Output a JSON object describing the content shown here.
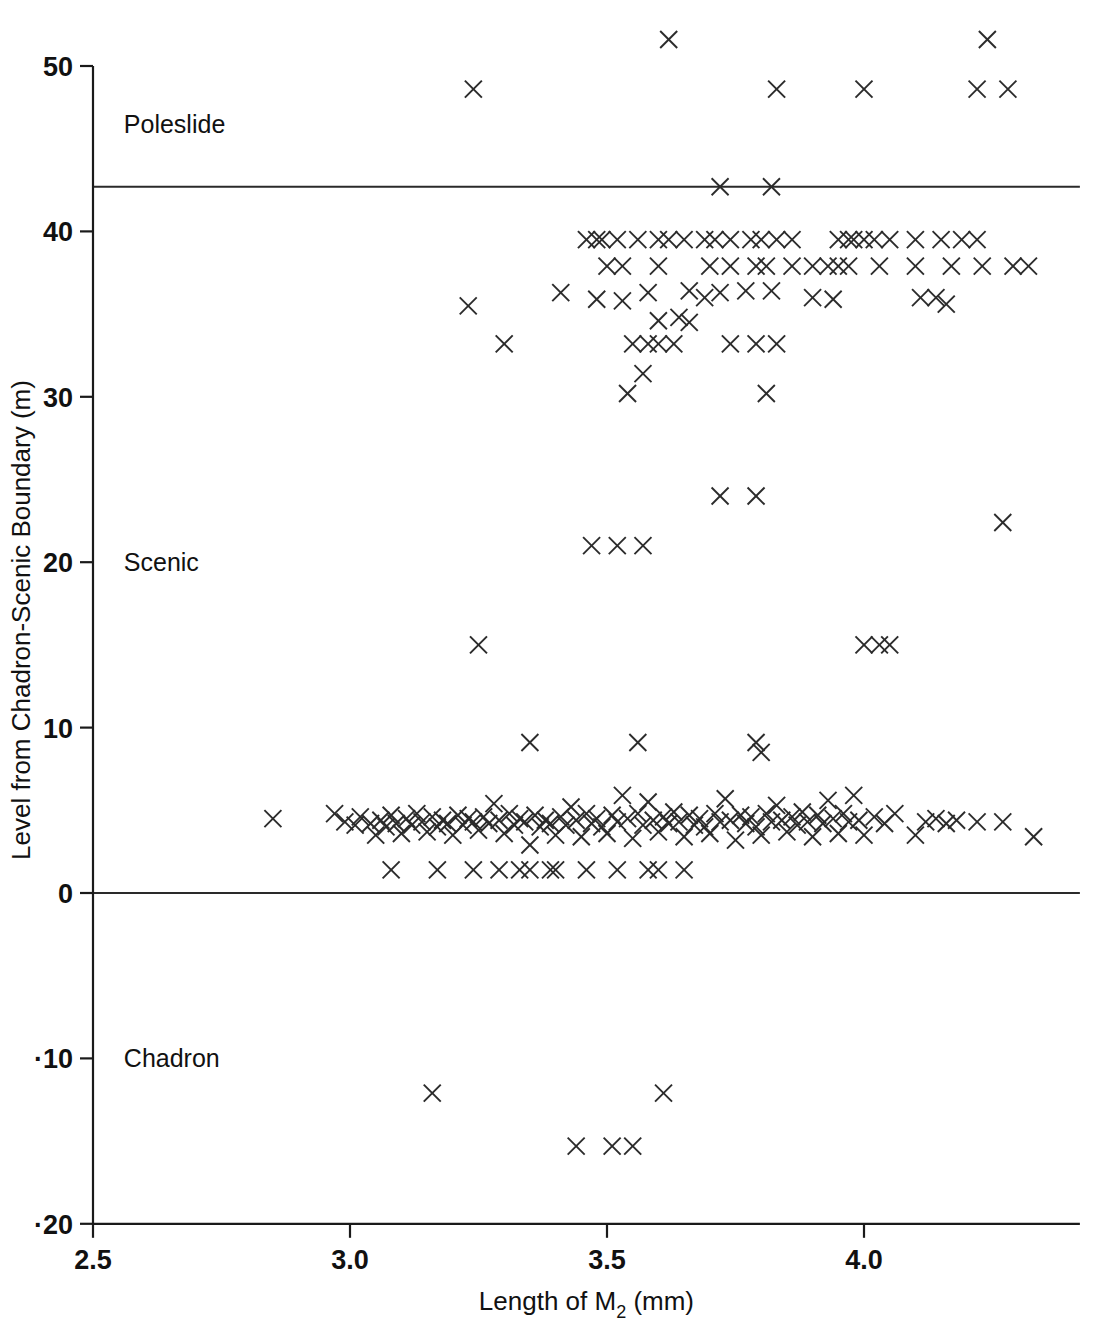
{
  "figure": {
    "kind": "scatter-plot",
    "background_color": "#ffffff",
    "ink_color": "#1a1a1a",
    "marker_glyph": "X"
  },
  "axes": {
    "y_title": "Level from Chadron-Scenic Boundary (m)",
    "x_title_parts": {
      "before": "Length of M",
      "subscript": "2",
      "after": " (mm)"
    },
    "x_title_plain": "Length of M2 (mm)",
    "y_ticks": [
      "50",
      "40",
      "30",
      "20",
      "10",
      "0",
      "·10",
      "·20"
    ],
    "y_tick_values": [
      50,
      40,
      30,
      20,
      10,
      0,
      -10,
      -20
    ],
    "x_ticks": [
      "2.5",
      "3.0",
      "3.5",
      "4.0"
    ],
    "x_tick_values": [
      2.5,
      3.0,
      3.5,
      4.0
    ]
  },
  "unit_labels": [
    {
      "name": "Poleslide",
      "level": 46.5
    },
    {
      "name": "Scenic",
      "level": 20.0
    },
    {
      "name": "Chadron",
      "level": -10.0
    }
  ],
  "boundaries": [
    {
      "label": "Poleslide-Scenic boundary",
      "level": 42.7
    },
    {
      "label": "Chadron-Scenic boundary",
      "level": 0.0
    },
    {
      "label": "lower plot frame",
      "level": -20.0
    }
  ],
  "chart_data": {
    "type": "scatter",
    "title": "",
    "xlabel": "Length of M2 (mm)",
    "ylabel": "Level from Chadron-Scenic Boundary (m)",
    "xlim": [
      2.5,
      4.4
    ],
    "ylim": [
      -20,
      52.5
    ],
    "grid": false,
    "legend": "none",
    "marker": "x",
    "series": [
      {
        "name": "Specimens",
        "points": [
          [
            3.62,
            51.6
          ],
          [
            4.24,
            51.6
          ],
          [
            3.24,
            48.6
          ],
          [
            3.83,
            48.6
          ],
          [
            4.0,
            48.6
          ],
          [
            4.22,
            48.6
          ],
          [
            4.28,
            48.6
          ],
          [
            3.72,
            42.7
          ],
          [
            3.82,
            42.7
          ],
          [
            3.46,
            39.5
          ],
          [
            3.48,
            39.5
          ],
          [
            3.49,
            39.5
          ],
          [
            3.52,
            39.5
          ],
          [
            3.56,
            39.5
          ],
          [
            3.6,
            39.5
          ],
          [
            3.62,
            39.5
          ],
          [
            3.65,
            39.5
          ],
          [
            3.69,
            39.5
          ],
          [
            3.71,
            39.5
          ],
          [
            3.74,
            39.5
          ],
          [
            3.78,
            39.5
          ],
          [
            3.8,
            39.5
          ],
          [
            3.83,
            39.5
          ],
          [
            3.86,
            39.5
          ],
          [
            3.95,
            39.5
          ],
          [
            3.97,
            39.5
          ],
          [
            3.98,
            39.5
          ],
          [
            4.0,
            39.5
          ],
          [
            4.02,
            39.5
          ],
          [
            4.05,
            39.5
          ],
          [
            4.1,
            39.5
          ],
          [
            4.15,
            39.5
          ],
          [
            4.19,
            39.5
          ],
          [
            4.22,
            39.5
          ],
          [
            3.5,
            37.9
          ],
          [
            3.53,
            37.9
          ],
          [
            3.6,
            37.9
          ],
          [
            3.7,
            37.9
          ],
          [
            3.74,
            37.9
          ],
          [
            3.79,
            37.9
          ],
          [
            3.81,
            37.9
          ],
          [
            3.86,
            37.9
          ],
          [
            3.9,
            37.9
          ],
          [
            3.93,
            37.9
          ],
          [
            3.95,
            37.9
          ],
          [
            3.97,
            37.9
          ],
          [
            4.03,
            37.9
          ],
          [
            4.1,
            37.9
          ],
          [
            4.17,
            37.9
          ],
          [
            4.23,
            37.9
          ],
          [
            4.29,
            37.9
          ],
          [
            4.32,
            37.9
          ],
          [
            3.23,
            35.5
          ],
          [
            3.41,
            36.3
          ],
          [
            3.48,
            35.9
          ],
          [
            3.53,
            35.8
          ],
          [
            3.58,
            36.3
          ],
          [
            3.66,
            36.4
          ],
          [
            3.69,
            36.0
          ],
          [
            3.72,
            36.3
          ],
          [
            3.77,
            36.4
          ],
          [
            3.82,
            36.4
          ],
          [
            3.9,
            36.0
          ],
          [
            3.94,
            35.9
          ],
          [
            4.11,
            36.0
          ],
          [
            4.14,
            36.0
          ],
          [
            4.16,
            35.6
          ],
          [
            3.6,
            34.6
          ],
          [
            3.64,
            34.8
          ],
          [
            3.66,
            34.5
          ],
          [
            3.3,
            33.2
          ],
          [
            3.55,
            33.2
          ],
          [
            3.58,
            33.2
          ],
          [
            3.6,
            33.2
          ],
          [
            3.63,
            33.2
          ],
          [
            3.74,
            33.2
          ],
          [
            3.79,
            33.2
          ],
          [
            3.83,
            33.2
          ],
          [
            3.57,
            31.4
          ],
          [
            3.54,
            30.2
          ],
          [
            3.81,
            30.2
          ],
          [
            3.72,
            24.0
          ],
          [
            3.79,
            24.0
          ],
          [
            4.27,
            22.4
          ],
          [
            3.47,
            21.0
          ],
          [
            3.52,
            21.0
          ],
          [
            3.57,
            21.0
          ],
          [
            3.25,
            15.0
          ],
          [
            4.0,
            15.0
          ],
          [
            4.03,
            15.0
          ],
          [
            4.05,
            15.0
          ],
          [
            3.35,
            9.1
          ],
          [
            3.56,
            9.1
          ],
          [
            3.79,
            9.1
          ],
          [
            3.8,
            8.5
          ],
          [
            2.85,
            4.5
          ],
          [
            2.97,
            4.8
          ],
          [
            2.99,
            4.3
          ],
          [
            3.01,
            4.1
          ],
          [
            3.02,
            4.6
          ],
          [
            3.04,
            4.2
          ],
          [
            3.05,
            3.5
          ],
          [
            3.06,
            4.4
          ],
          [
            3.07,
            4.0
          ],
          [
            3.08,
            4.7
          ],
          [
            3.09,
            4.2
          ],
          [
            3.1,
            3.6
          ],
          [
            3.11,
            4.5
          ],
          [
            3.12,
            4.1
          ],
          [
            3.13,
            4.8
          ],
          [
            3.14,
            4.3
          ],
          [
            3.15,
            3.7
          ],
          [
            3.16,
            4.6
          ],
          [
            3.17,
            4.0
          ],
          [
            3.18,
            4.4
          ],
          [
            3.19,
            4.2
          ],
          [
            3.2,
            3.5
          ],
          [
            3.21,
            4.7
          ],
          [
            3.22,
            4.1
          ],
          [
            3.23,
            4.5
          ],
          [
            3.24,
            4.3
          ],
          [
            3.25,
            3.8
          ],
          [
            3.26,
            4.6
          ],
          [
            3.27,
            4.2
          ],
          [
            3.28,
            5.4
          ],
          [
            3.29,
            4.4
          ],
          [
            3.3,
            3.6
          ],
          [
            3.31,
            4.8
          ],
          [
            3.32,
            4.1
          ],
          [
            3.33,
            4.5
          ],
          [
            3.34,
            4.3
          ],
          [
            3.35,
            2.9
          ],
          [
            3.36,
            4.7
          ],
          [
            3.37,
            4.0
          ],
          [
            3.38,
            4.4
          ],
          [
            3.39,
            4.2
          ],
          [
            3.4,
            3.5
          ],
          [
            3.41,
            4.6
          ],
          [
            3.42,
            4.1
          ],
          [
            3.43,
            5.2
          ],
          [
            3.44,
            4.4
          ],
          [
            3.45,
            3.4
          ],
          [
            3.46,
            4.8
          ],
          [
            3.47,
            4.2
          ],
          [
            3.48,
            4.5
          ],
          [
            3.49,
            4.0
          ],
          [
            3.5,
            3.6
          ],
          [
            3.51,
            4.7
          ],
          [
            3.52,
            4.3
          ],
          [
            3.53,
            5.9
          ],
          [
            3.54,
            4.5
          ],
          [
            3.55,
            3.3
          ],
          [
            3.56,
            4.8
          ],
          [
            3.57,
            4.1
          ],
          [
            3.58,
            5.5
          ],
          [
            3.59,
            4.4
          ],
          [
            3.6,
            3.7
          ],
          [
            3.61,
            4.6
          ],
          [
            3.62,
            4.2
          ],
          [
            3.63,
            4.9
          ],
          [
            3.64,
            4.3
          ],
          [
            3.65,
            3.4
          ],
          [
            3.66,
            4.7
          ],
          [
            3.67,
            4.1
          ],
          [
            3.68,
            4.5
          ],
          [
            3.69,
            4.0
          ],
          [
            3.7,
            3.6
          ],
          [
            3.71,
            4.8
          ],
          [
            3.72,
            4.3
          ],
          [
            3.73,
            5.7
          ],
          [
            3.74,
            4.4
          ],
          [
            3.75,
            3.2
          ],
          [
            3.76,
            4.7
          ],
          [
            3.77,
            4.2
          ],
          [
            3.78,
            4.6
          ],
          [
            3.79,
            4.0
          ],
          [
            3.8,
            3.5
          ],
          [
            3.81,
            4.8
          ],
          [
            3.82,
            4.3
          ],
          [
            3.83,
            5.3
          ],
          [
            3.84,
            4.4
          ],
          [
            3.85,
            3.7
          ],
          [
            3.86,
            4.6
          ],
          [
            3.87,
            4.1
          ],
          [
            3.88,
            4.9
          ],
          [
            3.89,
            4.3
          ],
          [
            3.9,
            3.4
          ],
          [
            3.91,
            4.7
          ],
          [
            3.92,
            4.2
          ],
          [
            3.93,
            5.6
          ],
          [
            3.94,
            4.5
          ],
          [
            3.95,
            3.6
          ],
          [
            3.96,
            4.8
          ],
          [
            3.97,
            4.3
          ],
          [
            3.98,
            5.9
          ],
          [
            3.99,
            4.4
          ],
          [
            4.0,
            3.5
          ],
          [
            4.02,
            4.6
          ],
          [
            4.04,
            4.2
          ],
          [
            4.06,
            4.8
          ],
          [
            4.1,
            3.5
          ],
          [
            4.12,
            4.3
          ],
          [
            4.14,
            4.5
          ],
          [
            4.16,
            4.2
          ],
          [
            4.18,
            4.4
          ],
          [
            4.22,
            4.3
          ],
          [
            4.27,
            4.3
          ],
          [
            4.33,
            3.4
          ],
          [
            3.08,
            1.4
          ],
          [
            3.17,
            1.4
          ],
          [
            3.24,
            1.4
          ],
          [
            3.29,
            1.4
          ],
          [
            3.33,
            1.4
          ],
          [
            3.35,
            1.4
          ],
          [
            3.39,
            1.4
          ],
          [
            3.4,
            1.4
          ],
          [
            3.46,
            1.4
          ],
          [
            3.52,
            1.4
          ],
          [
            3.58,
            1.4
          ],
          [
            3.6,
            1.4
          ],
          [
            3.65,
            1.4
          ],
          [
            3.16,
            -12.1
          ],
          [
            3.61,
            -12.1
          ],
          [
            3.44,
            -15.3
          ],
          [
            3.51,
            -15.3
          ],
          [
            3.55,
            -15.3
          ]
        ]
      }
    ],
    "annotations": [
      {
        "text": "Poleslide",
        "x": 2.56,
        "y": 46.5
      },
      {
        "text": "Scenic",
        "x": 2.56,
        "y": 20.0
      },
      {
        "text": "Chadron",
        "x": 2.56,
        "y": -10.0
      }
    ],
    "reference_lines": [
      {
        "orientation": "horizontal",
        "y": 42.7
      },
      {
        "orientation": "horizontal",
        "y": 0.0
      },
      {
        "orientation": "horizontal",
        "y": -20.0
      }
    ]
  }
}
